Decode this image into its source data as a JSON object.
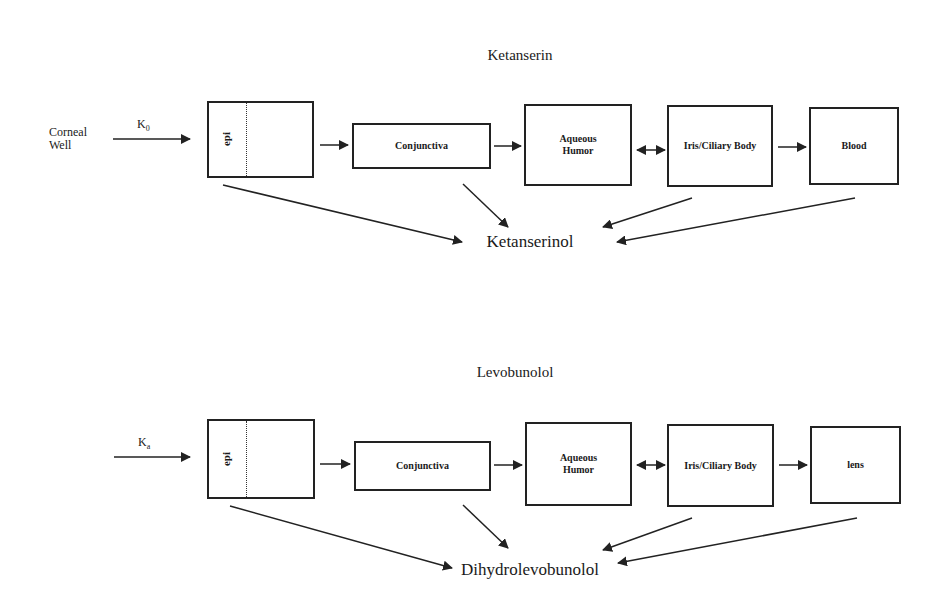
{
  "diagram_top": {
    "title": "Ketanserin",
    "source_label_line1": "Corneal",
    "source_label_line2": "Well",
    "rate_label": "K",
    "rate_subscript": "0",
    "epi_label": "epi",
    "compartments": [
      "Conjunctiva",
      "Aqueous Humor",
      "Iris/Ciliary Body",
      "Blood"
    ],
    "metabolite": "Ketanserinol"
  },
  "diagram_bottom": {
    "title": "Levobunolol",
    "rate_label": "K",
    "rate_subscript": "a",
    "epi_label": "epi",
    "compartments": [
      "Conjunctiva",
      "Aqueous Humor",
      "Iris/Ciliary Body",
      "lens"
    ],
    "metabolite": "Dihydrolevobunolol"
  }
}
